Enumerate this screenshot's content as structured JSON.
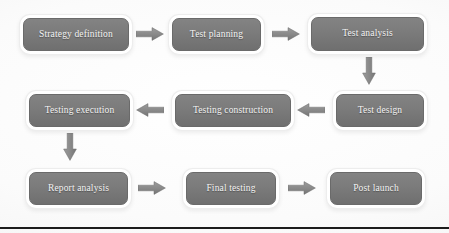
{
  "diagram": {
    "style": {
      "node_fill": "#7b7b7b",
      "node_border": "#ffffff",
      "node_text": "#f4f4f4",
      "arrow_fill": "#8a8a8a",
      "background": "#fdfdfd",
      "rule_color": "#1c1c1c"
    },
    "nodes": [
      {
        "id": "strategy-definition",
        "label": "Strategy definition",
        "row": 1,
        "col": 1
      },
      {
        "id": "test-planning",
        "label": "Test planning",
        "row": 1,
        "col": 2
      },
      {
        "id": "test-analysis",
        "label": "Test analysis",
        "row": 1,
        "col": 3
      },
      {
        "id": "testing-execution",
        "label": "Testing execution",
        "row": 2,
        "col": 1
      },
      {
        "id": "testing-construction",
        "label": "Testing construction",
        "row": 2,
        "col": 2
      },
      {
        "id": "test-design",
        "label": "Test design",
        "row": 2,
        "col": 3
      },
      {
        "id": "report-analysis",
        "label": "Report analysis",
        "row": 3,
        "col": 1
      },
      {
        "id": "final-testing",
        "label": "Final testing",
        "row": 3,
        "col": 2
      },
      {
        "id": "post-launch",
        "label": "Post launch",
        "row": 3,
        "col": 3
      }
    ],
    "arrows": [
      {
        "id": "strategy-definition-to-test-planning",
        "from": "strategy-definition",
        "to": "test-planning",
        "direction": "right"
      },
      {
        "id": "test-planning-to-test-analysis",
        "from": "test-planning",
        "to": "test-analysis",
        "direction": "right"
      },
      {
        "id": "test-analysis-to-test-design",
        "from": "test-analysis",
        "to": "test-design",
        "direction": "down"
      },
      {
        "id": "test-design-to-testing-construction",
        "from": "test-design",
        "to": "testing-construction",
        "direction": "left"
      },
      {
        "id": "testing-construction-to-testing-execution",
        "from": "testing-construction",
        "to": "testing-execution",
        "direction": "left"
      },
      {
        "id": "testing-execution-to-report-analysis",
        "from": "testing-execution",
        "to": "report-analysis",
        "direction": "down"
      },
      {
        "id": "report-analysis-to-final-testing",
        "from": "report-analysis",
        "to": "final-testing",
        "direction": "right"
      },
      {
        "id": "final-testing-to-post-launch",
        "from": "final-testing",
        "to": "post-launch",
        "direction": "right"
      }
    ]
  }
}
